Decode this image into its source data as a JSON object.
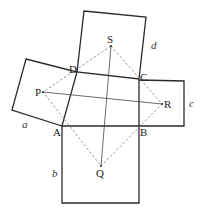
{
  "diagram": {
    "title": "",
    "vertices": {
      "A": "A",
      "B": "B",
      "C": "C",
      "D": "D"
    },
    "centers": {
      "P": "P",
      "Q": "Q",
      "R": "R",
      "S": "S"
    },
    "side_labels": {
      "a": "a",
      "b": "b",
      "c": "c",
      "d": "d"
    },
    "colors": {
      "square_stroke": "#2a2a2a",
      "dashed_stroke": "#8a8a8a",
      "segment_stroke": "#444444"
    }
  }
}
